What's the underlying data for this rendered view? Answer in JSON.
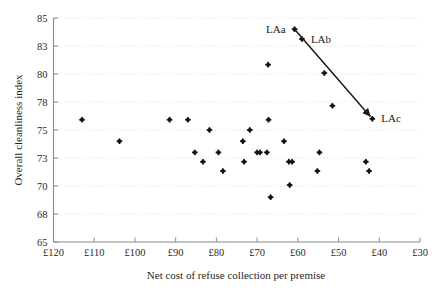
{
  "chart_data": {
    "type": "scatter",
    "title": "",
    "xlabel": "Net cost of refuse collection per premise",
    "ylabel": "Overall cleanliness index",
    "xlim": [
      120,
      30
    ],
    "ylim": [
      65,
      85
    ],
    "x_inverted": true,
    "grid": true,
    "legend": null,
    "x_tick_labels": [
      "£120",
      "£110",
      "£100",
      "£90",
      "£80",
      "£70",
      "£60",
      "£50",
      "£40",
      "£30"
    ],
    "x_tick_values": [
      120,
      110,
      100,
      90,
      80,
      70,
      60,
      50,
      40,
      30
    ],
    "y_tick_labels": [
      "85",
      "83",
      "80",
      "78",
      "75",
      "73",
      "70",
      "68",
      "65"
    ],
    "y_tick_values": [
      85,
      83,
      80,
      78,
      75,
      73,
      70,
      68,
      65
    ],
    "points": [
      {
        "x": 113.0,
        "y": 76.1,
        "label": ""
      },
      {
        "x": 103.8,
        "y": 74.2,
        "label": ""
      },
      {
        "x": 91.5,
        "y": 76.1,
        "label": ""
      },
      {
        "x": 87.0,
        "y": 76.1,
        "label": ""
      },
      {
        "x": 85.3,
        "y": 73.4,
        "label": ""
      },
      {
        "x": 83.3,
        "y": 72.6,
        "label": ""
      },
      {
        "x": 81.7,
        "y": 75.0,
        "label": ""
      },
      {
        "x": 79.5,
        "y": 73.4,
        "label": ""
      },
      {
        "x": 78.4,
        "y": 71.6,
        "label": ""
      },
      {
        "x": 73.5,
        "y": 74.2,
        "label": ""
      },
      {
        "x": 73.2,
        "y": 72.6,
        "label": ""
      },
      {
        "x": 71.8,
        "y": 75.0,
        "label": ""
      },
      {
        "x": 70.0,
        "y": 73.4,
        "label": ""
      },
      {
        "x": 69.3,
        "y": 73.4,
        "label": ""
      },
      {
        "x": 67.6,
        "y": 73.4,
        "label": ""
      },
      {
        "x": 67.3,
        "y": 81.0,
        "label": ""
      },
      {
        "x": 67.2,
        "y": 76.1,
        "label": ""
      },
      {
        "x": 66.7,
        "y": 69.2,
        "label": ""
      },
      {
        "x": 63.4,
        "y": 74.2,
        "label": ""
      },
      {
        "x": 62.2,
        "y": 72.6,
        "label": ""
      },
      {
        "x": 61.4,
        "y": 72.6,
        "label": ""
      },
      {
        "x": 62.0,
        "y": 70.1,
        "label": ""
      },
      {
        "x": 54.7,
        "y": 73.4,
        "label": ""
      },
      {
        "x": 55.2,
        "y": 71.6,
        "label": ""
      },
      {
        "x": 53.5,
        "y": 80.1,
        "label": ""
      },
      {
        "x": 51.5,
        "y": 77.6,
        "label": ""
      },
      {
        "x": 43.3,
        "y": 72.6,
        "label": ""
      },
      {
        "x": 42.5,
        "y": 71.6,
        "label": ""
      },
      {
        "x": 60.8,
        "y": 84.2,
        "label": "LAa"
      },
      {
        "x": 59.0,
        "y": 83.5,
        "label": "LAb"
      },
      {
        "x": 41.7,
        "y": 76.2,
        "label": "LAc"
      }
    ],
    "annotation_line": {
      "from_label": "LAa",
      "to_label": "LAc",
      "arrow": true,
      "points": [
        {
          "x": 60.8,
          "y": 84.2
        },
        {
          "x": 41.7,
          "y": 76.2
        }
      ]
    },
    "labels": [
      {
        "text": "LAa",
        "x": 60.8,
        "y": 84.2,
        "anchor": "right"
      },
      {
        "text": "LAb",
        "x": 59.0,
        "y": 83.5,
        "anchor": "left"
      },
      {
        "text": "LAc",
        "x": 41.7,
        "y": 76.2,
        "anchor": "left"
      }
    ],
    "colors": {
      "point": "#111111",
      "grid": "#e9e9ee",
      "axis": "#8a8a8a",
      "text": "#1f1f1f",
      "line": "#1a1a1a",
      "background": "#ffffff"
    }
  }
}
